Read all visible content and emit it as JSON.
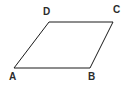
{
  "figure": {
    "kind": "geometry-diagram",
    "shape_name": "parallelogram",
    "background_color": "#ffffff",
    "stroke_color": "#1a1a1a",
    "stroke_width": 1,
    "label_color": "#2b2b2b",
    "width": 126,
    "height": 86,
    "vertices": [
      {
        "id": "A",
        "label": "A",
        "x": 14,
        "y": 68,
        "label_x": 9,
        "label_y": 72
      },
      {
        "id": "B",
        "label": "B",
        "x": 90,
        "y": 68,
        "label_x": 88,
        "label_y": 72
      },
      {
        "id": "C",
        "label": "C",
        "x": 113,
        "y": 22,
        "label_x": 113,
        "label_y": 5
      },
      {
        "id": "D",
        "label": "D",
        "x": 49,
        "y": 22,
        "label_x": 43,
        "label_y": 7
      }
    ],
    "edges": [
      {
        "id": "AB",
        "from": "A",
        "to": "B"
      },
      {
        "id": "BC",
        "from": "B",
        "to": "C"
      },
      {
        "id": "CD",
        "from": "C",
        "to": "D"
      },
      {
        "id": "DA",
        "from": "D",
        "to": "A"
      }
    ],
    "polygon_points": "14,68 90,68 113,22 49,22"
  }
}
